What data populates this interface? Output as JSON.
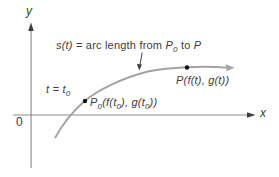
{
  "figure": {
    "background": "#ffffff",
    "axis_color": "#8c8c8c",
    "curve_color": "#a3a3a3",
    "arrow_color": "#3f3f3f",
    "dot_color": "#111111",
    "text_color": "#3d3d3d"
  },
  "axes": {
    "y_label": "y",
    "x_label": "x",
    "origin_label": "0"
  },
  "annotation": {
    "s_of_t": "s(t)",
    "mid": " = arc length from ",
    "p0_base": "P",
    "p0_sub": "0",
    "to": " to ",
    "p_end": "P"
  },
  "t_label": {
    "base": "t = t",
    "sub": "0"
  },
  "p0_label": {
    "s0": "P",
    "s1": "0",
    "s2": "(f(t",
    "s3": "0",
    "s4": "), g(t",
    "s5": "0",
    "s6": "))"
  },
  "p_label": {
    "text": "P(f(t), g(t))"
  }
}
